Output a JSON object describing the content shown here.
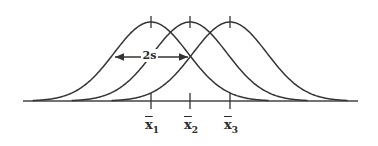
{
  "diagram": {
    "type": "overlapping-normal-distributions",
    "baseline": {
      "x1": 23,
      "x2": 358,
      "y": 101
    },
    "stroke_color": "#333333",
    "curves": [
      {
        "name": "curve-1",
        "mean_x": 151,
        "peak_y": 22,
        "sigma_px": 37
      },
      {
        "name": "curve-2",
        "mean_x": 190,
        "peak_y": 22,
        "sigma_px": 37
      },
      {
        "name": "curve-3",
        "mean_x": 230,
        "peak_y": 22,
        "sigma_px": 37
      }
    ],
    "spread_annotation": {
      "label": "2s",
      "arrow_x1": 115,
      "arrow_x2": 188,
      "arrow_y": 57
    },
    "mean_labels": [
      {
        "symbol": "x",
        "subscript": "1",
        "x": 151
      },
      {
        "symbol": "x",
        "subscript": "2",
        "x": 190
      },
      {
        "symbol": "x",
        "subscript": "3",
        "x": 230
      }
    ]
  }
}
